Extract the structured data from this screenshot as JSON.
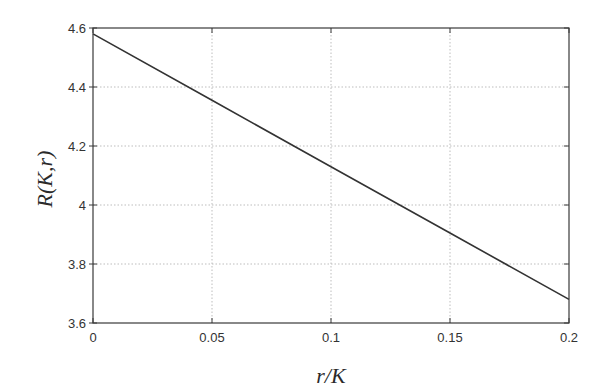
{
  "chart_data": {
    "type": "line",
    "title": "",
    "xlabel": "r/K",
    "ylabel": "R(K,r)",
    "xlim": [
      0,
      0.2
    ],
    "ylim": [
      3.6,
      4.6
    ],
    "x_ticks": [
      0,
      0.05,
      0.1,
      0.15,
      0.2
    ],
    "x_tick_labels": [
      "0",
      "0.05",
      "0.1",
      "0.15",
      "0.2"
    ],
    "y_ticks": [
      3.6,
      3.8,
      4.0,
      4.2,
      4.4,
      4.6
    ],
    "y_tick_labels": [
      "3.6",
      "3.8",
      "4",
      "4.2",
      "4.4",
      "4.6"
    ],
    "grid": true,
    "legend": null,
    "series": [
      {
        "name": "R(K,r)",
        "color": "#333333",
        "x": [
          0,
          0.05,
          0.1,
          0.15,
          0.2
        ],
        "y": [
          4.58,
          4.355,
          4.13,
          3.905,
          3.68
        ]
      }
    ]
  },
  "colors": {
    "frame": "#3a3a3a",
    "grid": "#bdbdbd",
    "line": "#333333",
    "background": "#ffffff"
  }
}
